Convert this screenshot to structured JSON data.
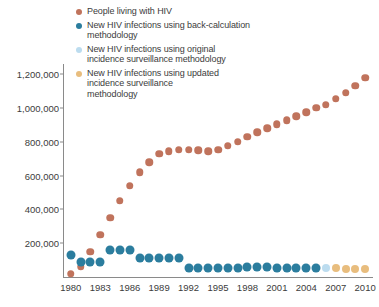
{
  "legend": {
    "position": "top-center",
    "entries": [
      {
        "label": "People living with HIV",
        "color": "#c0735c",
        "key": "prevalence"
      },
      {
        "label": "New HIV infections using back-calculation\nmethodology",
        "color": "#2b7d9e",
        "key": "back_calculation"
      },
      {
        "label": "New HIV infections using original\nincidence surveillance methodology",
        "color": "#bcdcef",
        "key": "original_surveillance"
      },
      {
        "label": "New HIV infections using updated\nincidence surveillance\nmethodology",
        "color": "#e8bd7e",
        "key": "updated_surveillance"
      }
    ]
  },
  "axes": {
    "y_ticks": [
      "200,000",
      "400,000",
      "600,000",
      "800,000",
      "1,000,000",
      "1,200,000"
    ],
    "y_tick_values": [
      200000,
      400000,
      600000,
      800000,
      1000000,
      1200000
    ],
    "x_ticks": [
      "1980",
      "1983",
      "1986",
      "1989",
      "1992",
      "1995",
      "1998",
      "2001",
      "2004",
      "2007",
      "2010"
    ],
    "x_tick_values": [
      1980,
      1983,
      1986,
      1989,
      1992,
      1995,
      1998,
      2001,
      2004,
      2007,
      2010
    ]
  },
  "chart_data": {
    "type": "scatter",
    "title": "",
    "subtitle": "",
    "xlabel": "",
    "ylabel": "",
    "xlim": [
      1979.2,
      2010.8
    ],
    "ylim": [
      0,
      1260000
    ],
    "grid": false,
    "legend_position": "top-center",
    "series": [
      {
        "name": "People living with HIV",
        "color": "#c0735c",
        "marker": "circle",
        "x": [
          1980,
          1981,
          1982,
          1983,
          1984,
          1985,
          1986,
          1987,
          1988,
          1989,
          1990,
          1991,
          1992,
          1993,
          1994,
          1995,
          1996,
          1997,
          1998,
          1999,
          2000,
          2001,
          2002,
          2003,
          2004,
          2005,
          2006,
          2007,
          2008,
          2009,
          2010
        ],
        "values": [
          20000,
          60000,
          150000,
          250000,
          350000,
          450000,
          540000,
          620000,
          680000,
          730000,
          745000,
          752000,
          753000,
          750000,
          744000,
          752000,
          775000,
          800000,
          830000,
          855000,
          880000,
          905000,
          928000,
          950000,
          975000,
          1000000,
          1020000,
          1055000,
          1090000,
          1130000,
          1180000
        ]
      },
      {
        "name": "New HIV infections using back-calculation methodology",
        "color": "#2b7d9e",
        "marker": "circle",
        "x": [
          1980,
          1981,
          1982,
          1983,
          1984,
          1985,
          1986,
          1987,
          1988,
          1989,
          1990,
          1991,
          1992,
          1993,
          1994,
          1995,
          1996,
          1997,
          1998,
          1999,
          2000,
          2001,
          2002,
          2003,
          2004,
          2005
        ],
        "values": [
          130000,
          88000,
          88000,
          88000,
          160000,
          160000,
          160000,
          110000,
          110000,
          112000,
          112000,
          112000,
          56000,
          56000,
          56000,
          56000,
          56000,
          56000,
          62000,
          62000,
          62000,
          56000,
          56000,
          56000,
          56000,
          56000
        ]
      },
      {
        "name": "New HIV infections using original incidence surveillance methodology",
        "color": "#bcdcef",
        "marker": "circle",
        "x": [
          2006
        ],
        "values": [
          56000
        ]
      },
      {
        "name": "New HIV infections using updated incidence surveillance methodology",
        "color": "#e8bd7e",
        "marker": "circle",
        "x": [
          2007,
          2008,
          2009,
          2010
        ],
        "values": [
          52000,
          50000,
          50000,
          48000
        ]
      }
    ]
  }
}
